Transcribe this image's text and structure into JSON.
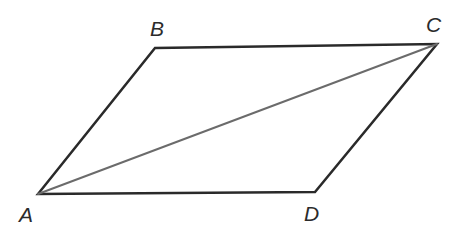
{
  "figure": {
    "kind": "geometry-diagram",
    "shape_name": "parallelogram",
    "background_color": "#ffffff",
    "width": 463,
    "height": 241,
    "outline_color": "#2a2a2a",
    "outline_width": 2.5,
    "diagonal_color": "#6b6b6b",
    "diagonal_width": 2.0,
    "label_color": "#2b2b2b",
    "vertices": [
      {
        "id": "A",
        "label": "A",
        "x": 38,
        "y": 194,
        "label_x": 19,
        "label_y": 204
      },
      {
        "id": "B",
        "label": "B",
        "x": 155,
        "y": 48,
        "label_x": 150,
        "label_y": 18
      },
      {
        "id": "C",
        "label": "C",
        "x": 437,
        "y": 44,
        "label_x": 426,
        "label_y": 14
      },
      {
        "id": "D",
        "label": "D",
        "x": 315,
        "y": 192,
        "label_x": 304,
        "label_y": 203
      }
    ],
    "edges": [
      {
        "id": "AB",
        "from": "A",
        "to": "B",
        "style": "solid-dark"
      },
      {
        "id": "BC",
        "from": "B",
        "to": "C",
        "style": "solid-dark"
      },
      {
        "id": "CD",
        "from": "C",
        "to": "D",
        "style": "solid-dark"
      },
      {
        "id": "DA",
        "from": "D",
        "to": "A",
        "style": "solid-dark"
      }
    ],
    "diagonals": [
      {
        "id": "AC",
        "from": "A",
        "to": "C",
        "style": "solid-gray"
      }
    ],
    "outline_path": "M 38 194 L 155 48 L 437 44 L 315 192 Z",
    "diagonal_path": "M 38 194 L 437 44"
  }
}
